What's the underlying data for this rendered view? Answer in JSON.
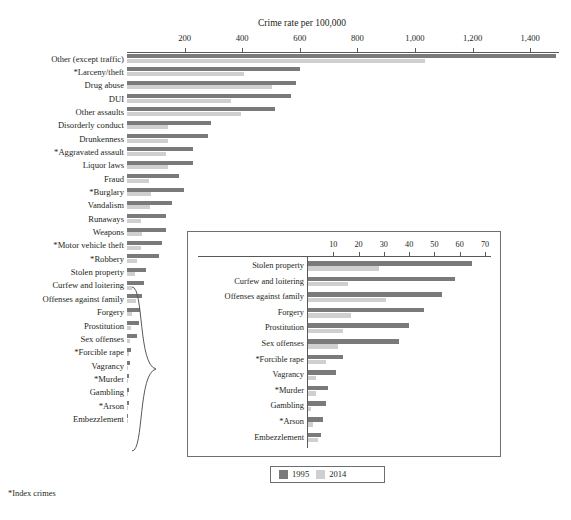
{
  "chart_data": {
    "type": "bar",
    "orientation": "horizontal",
    "title": "",
    "xlabel": "Crime rate per 100,000",
    "ylabel": "",
    "grid": false,
    "legend_position": "bottom",
    "xlim": [
      0,
      1500
    ],
    "xticks": [
      200,
      400,
      600,
      800,
      1000,
      1200,
      1400
    ],
    "xtick_labels": [
      "200",
      "400",
      "600",
      "800",
      "1,000",
      "1,200",
      "1,400"
    ],
    "series": [
      {
        "name": "1995",
        "color": "#7a7a7a"
      },
      {
        "name": "2014",
        "color": "#cfcfcf"
      }
    ],
    "categories": [
      "Other (except traffic)",
      "*Larceny/theft",
      "Drug abuse",
      "DUI",
      "Other assaults",
      "Disorderly conduct",
      "Drunkenness",
      "*Aggravated assault",
      "Liquor laws",
      "Fraud",
      "*Burglary",
      "Vandalism",
      "Runaways",
      "Weapons",
      "*Motor vehicle theft",
      "*Robbery",
      "Stolen property",
      "Curfew and loitering",
      "Offenses against family",
      "Forgery",
      "Prostitution",
      "Sex offenses",
      "*Forcible rape",
      "Vagrancy",
      "*Murder",
      "Gambling",
      "*Arson",
      "Embezzlement"
    ],
    "values_1995": [
      1490,
      600,
      588,
      570,
      513,
      292,
      281,
      230,
      228,
      182,
      199,
      155,
      136,
      137,
      120,
      110,
      65,
      58,
      53,
      46,
      40,
      36,
      14,
      11,
      8,
      7,
      6,
      5
    ],
    "values_2014": [
      1035,
      406,
      504,
      360,
      397,
      142,
      143,
      135,
      143,
      75,
      84,
      80,
      48,
      53,
      47,
      34,
      28,
      16,
      31,
      17,
      14,
      12,
      7,
      3,
      3,
      1,
      2,
      4
    ]
  },
  "inset": {
    "xlabel": "",
    "xlim": [
      0,
      70
    ],
    "xticks": [
      10,
      20,
      30,
      40,
      50,
      60,
      70
    ],
    "xtick_labels": [
      "10",
      "20",
      "30",
      "40",
      "50",
      "60",
      "70"
    ],
    "categories": [
      "Stolen property",
      "Curfew and loitering",
      "Offenses against family",
      "Forgery",
      "Prostitution",
      "Sex offenses",
      "*Forcible rape",
      "Vagrancy",
      "*Murder",
      "Gambling",
      "*Arson",
      "Embezzlement"
    ],
    "values_1995": [
      65,
      58,
      53,
      46,
      40,
      36,
      14,
      11,
      8,
      7,
      6,
      5
    ],
    "values_2014": [
      28,
      16,
      31,
      17,
      14,
      12,
      7,
      3,
      3,
      1,
      2,
      4
    ]
  },
  "legend": {
    "items": [
      {
        "label": "1995",
        "color": "#7a7a7a"
      },
      {
        "label": "2014",
        "color": "#cfcfcf"
      }
    ]
  },
  "footnote": "*Index crimes"
}
